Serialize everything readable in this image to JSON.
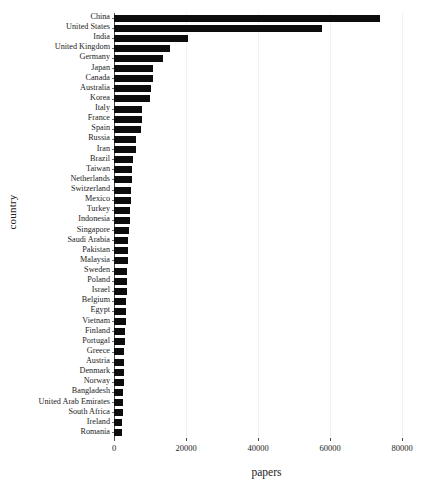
{
  "chart_data": {
    "type": "bar",
    "orientation": "horizontal",
    "title": "",
    "xlabel": "papers",
    "ylabel": "country",
    "xlim": [
      0,
      85000
    ],
    "ylim": [
      0,
      41
    ],
    "grid": "vertical-only",
    "legend": "none",
    "bar_color": "#0d0d0d",
    "xticks": [
      0,
      20000,
      40000,
      60000,
      80000
    ],
    "xtick_labels": [
      "0",
      "20000",
      "40000",
      "60000",
      "80000"
    ],
    "categories": [
      "China",
      "United States",
      "India",
      "United Kingdom",
      "Germany",
      "Japan",
      "Canada",
      "Australia",
      "Korea",
      "Italy",
      "France",
      "Spain",
      "Russia",
      "Iran",
      "Brazil",
      "Taiwan",
      "Netherlands",
      "Switzerland",
      "Mexico",
      "Turkey",
      "Indonesia",
      "Singapore",
      "Saudi Arabia",
      "Pakistan",
      "Malaysia",
      "Sweden",
      "Poland",
      "Israel",
      "Belgium",
      "Egypt",
      "Vietnam",
      "Finland",
      "Portugal",
      "Greece",
      "Austria",
      "Denmark",
      "Norway",
      "Bangladesh",
      "United Arab Emirates",
      "South Africa",
      "Ireland",
      "Romania"
    ],
    "values": [
      74000,
      57700,
      20600,
      15500,
      13700,
      10800,
      10700,
      10300,
      10000,
      7800,
      7700,
      7500,
      6200,
      6000,
      5200,
      5000,
      4900,
      4700,
      4600,
      4500,
      4400,
      4200,
      4000,
      3900,
      3800,
      3700,
      3600,
      3500,
      3400,
      3300,
      3200,
      3100,
      3000,
      2900,
      2850,
      2800,
      2700,
      2600,
      2500,
      2400,
      2300,
      2200
    ],
    "ylabel_text": "country",
    "xlabel_text": "papers"
  }
}
